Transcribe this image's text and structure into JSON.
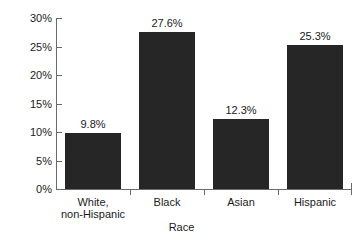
{
  "chart_data": {
    "type": "bar",
    "title": "",
    "xlabel": "Race",
    "ylabel": "Percent",
    "categories": [
      "White,\nnon-Hispanic",
      "Black",
      "Asian",
      "Hispanic"
    ],
    "values": [
      9.8,
      27.6,
      12.3,
      25.3
    ],
    "value_labels": [
      "9.8%",
      "27.6%",
      "12.3%",
      "25.3%"
    ],
    "ylim": [
      0,
      30
    ],
    "yticks": [
      0,
      5,
      10,
      15,
      20,
      25,
      30
    ],
    "ytick_labels": [
      "0%",
      "5%",
      "10%",
      "15%",
      "20%",
      "25%",
      "30%"
    ],
    "grid": false,
    "legend": "none",
    "bar_color": "#262626",
    "axis_color": "#6a6a6a",
    "text_color": "#1a1a1a",
    "background": "#ffffff"
  }
}
